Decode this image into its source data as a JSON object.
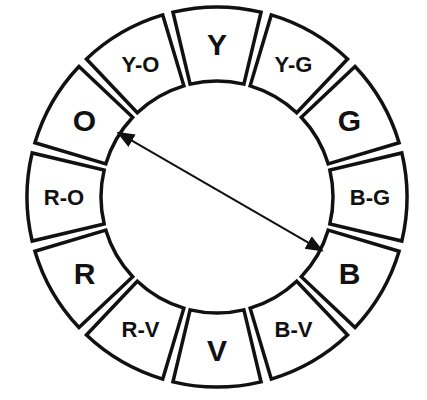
{
  "diagram": {
    "title": "",
    "type": "color-wheel",
    "center": [
      217,
      197
    ],
    "outer_radius": 190,
    "inner_radius": 116,
    "segments": [
      {
        "label": "Y",
        "angle": -90,
        "size": 30
      },
      {
        "label": "Y-G",
        "angle": -60,
        "size": 22
      },
      {
        "label": "G",
        "angle": -30,
        "size": 30
      },
      {
        "label": "B-G",
        "angle": 0,
        "size": 22
      },
      {
        "label": "B",
        "angle": 30,
        "size": 30
      },
      {
        "label": "B-V",
        "angle": 60,
        "size": 22
      },
      {
        "label": "V",
        "angle": 90,
        "size": 30
      },
      {
        "label": "R-V",
        "angle": 120,
        "size": 22
      },
      {
        "label": "R",
        "angle": 150,
        "size": 30
      },
      {
        "label": "R-O",
        "angle": 180,
        "size": 22
      },
      {
        "label": "O",
        "angle": 210,
        "size": 30
      },
      {
        "label": "Y-O",
        "angle": 240,
        "size": 22
      }
    ],
    "arrow": {
      "from": "O",
      "to": "B",
      "double_headed": true,
      "meaning": "complementary colors"
    },
    "colors": {
      "stroke": "#111111",
      "fill": "#ffffff"
    }
  }
}
